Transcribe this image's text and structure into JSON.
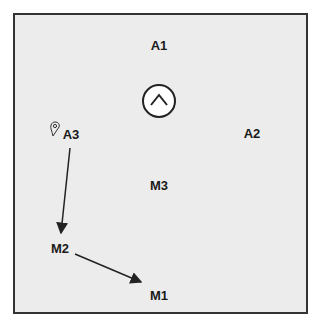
{
  "diagram": {
    "labels": {
      "a1": "A1",
      "a2": "A2",
      "a3": "A3",
      "m1": "M1",
      "m2": "M2",
      "m3": "M3"
    },
    "icons": {
      "up": "chevron-up-in-circle",
      "marker": "location-pin"
    },
    "arrows": [
      {
        "from": "A3",
        "to": "M2"
      },
      {
        "from": "M2",
        "to": "M1"
      }
    ],
    "colors": {
      "background": "#ececec",
      "border": "#333333",
      "text": "#1a1a1a"
    }
  }
}
